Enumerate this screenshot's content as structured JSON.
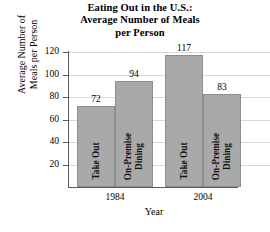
{
  "chart_data": {
    "type": "bar",
    "title": "Eating Out in the U.S.: Average Number of Meals per Person",
    "title_lines": [
      "Eating Out in the U.S.:",
      "Average Number of Meals",
      "per Person"
    ],
    "xlabel": "Year",
    "ylabel": "Average Number of Meals per Person",
    "ylabel_lines": [
      "Average Number of",
      "Meals per Person"
    ],
    "categories": [
      "1984",
      "2004"
    ],
    "series": [
      {
        "name": "Take Out",
        "values": [
          72,
          117
        ]
      },
      {
        "name": "On-Premise Dining",
        "values": [
          94,
          83
        ]
      }
    ],
    "bars": [
      {
        "group": "1984",
        "series": "Take Out",
        "series_lines": [
          "Take Out"
        ],
        "value": 72
      },
      {
        "group": "1984",
        "series": "On-Premise Dining",
        "series_lines": [
          "On-Premise",
          "Dining"
        ],
        "value": 94
      },
      {
        "group": "2004",
        "series": "Take Out",
        "series_lines": [
          "Take Out"
        ],
        "value": 117
      },
      {
        "group": "2004",
        "series": "On-Premise Dining",
        "series_lines": [
          "On-Premise",
          "Dining"
        ],
        "value": 83
      }
    ],
    "ylim": [
      0,
      120
    ],
    "yticks": [
      20,
      40,
      60,
      80,
      100,
      120
    ],
    "ytick_labels": [
      "20",
      "40",
      "60",
      "80",
      "100",
      "120"
    ],
    "grid": true,
    "legend": "none",
    "bar_color": "#a9a9a9",
    "grid_color": "#d8d8d8",
    "axis_color": "#5a5a5a"
  }
}
